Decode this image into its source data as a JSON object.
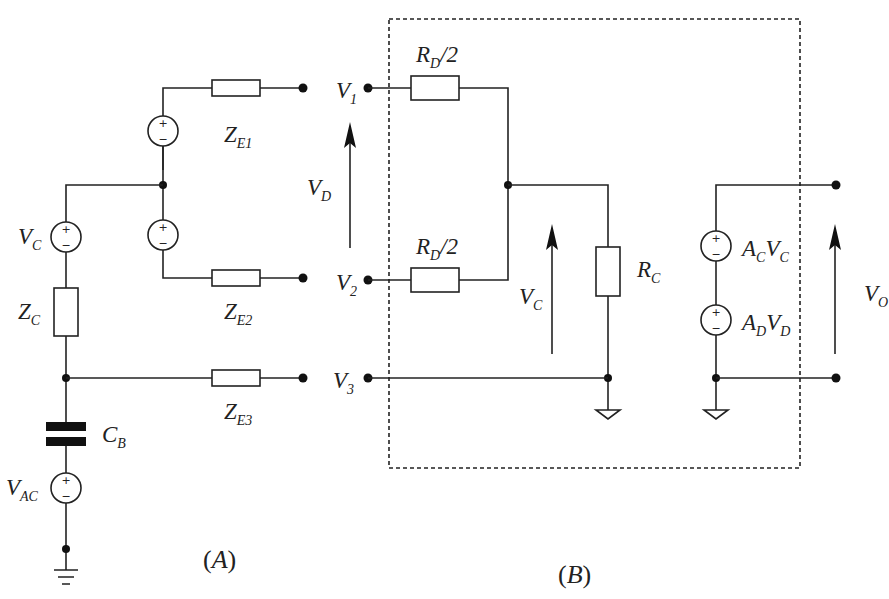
{
  "diagram": {
    "panel_a": {
      "caption": "A",
      "labels": {
        "vc": {
          "main": "V",
          "sub": "C"
        },
        "zc": {
          "main": "Z",
          "sub": "C"
        },
        "cb": {
          "main": "C",
          "sub": "B"
        },
        "vac": {
          "main": "V",
          "sub": "AC"
        },
        "ze1": {
          "main": "Z",
          "sub": "E1"
        },
        "ze2": {
          "main": "Z",
          "sub": "E2"
        },
        "ze3": {
          "main": "Z",
          "sub": "E3"
        }
      }
    },
    "terminals": {
      "v1": {
        "main": "V",
        "sub": "1"
      },
      "v2": {
        "main": "V",
        "sub": "2"
      },
      "v3": {
        "main": "V",
        "sub": "3"
      },
      "vd": {
        "main": "V",
        "sub": "D"
      }
    },
    "panel_b": {
      "caption": "B",
      "labels": {
        "rd_top": {
          "main": "R",
          "sub": "D",
          "tail": "/2"
        },
        "rd_bot": {
          "main": "R",
          "sub": "D",
          "tail": "/2"
        },
        "vc": {
          "main": "V",
          "sub": "C"
        },
        "rc": {
          "main": "R",
          "sub": "C"
        },
        "acvc": {
          "a": "A",
          "asub": "C",
          "v": "V",
          "vsub": "C"
        },
        "advd": {
          "a": "A",
          "asub": "D",
          "v": "V",
          "vsub": "D"
        },
        "vo": {
          "main": "V",
          "sub": "O"
        }
      }
    },
    "symbols": {
      "plus": "+",
      "minus": "−"
    }
  }
}
